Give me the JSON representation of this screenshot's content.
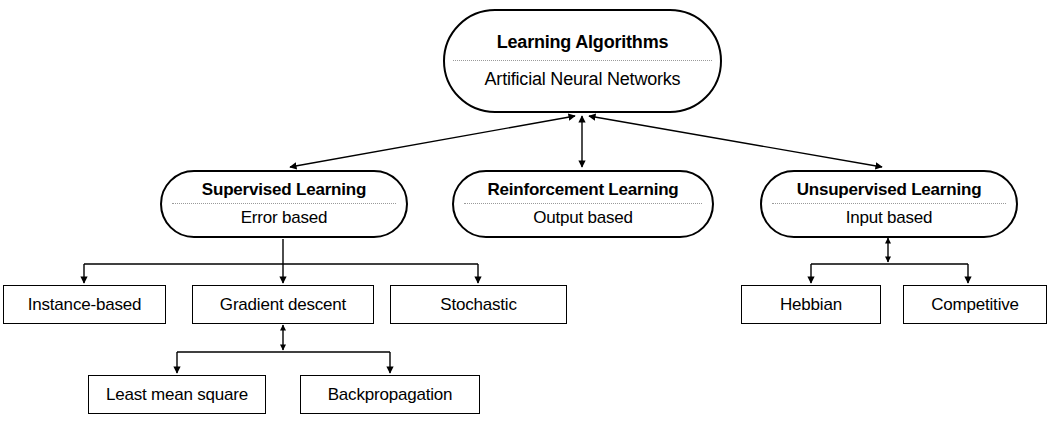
{
  "diagram": {
    "colors": {
      "stroke": "#000000",
      "background": "#ffffff",
      "divider": "#9a9a9a"
    },
    "root": {
      "title": "Learning Algorithms",
      "subtitle": "Artificial Neural Networks"
    },
    "paradigms": [
      {
        "title": "Supervised Learning",
        "subtitle": "Error based"
      },
      {
        "title": "Reinforcement Learning",
        "subtitle": "Output based"
      },
      {
        "title": "Unsupervised Learning",
        "subtitle": "Input based"
      }
    ],
    "supervised_methods": [
      {
        "label": "Instance-based"
      },
      {
        "label": "Gradient descent"
      },
      {
        "label": "Stochastic"
      }
    ],
    "gradient_descent_methods": [
      {
        "label": "Least mean square"
      },
      {
        "label": "Backpropagation"
      }
    ],
    "unsupervised_methods": [
      {
        "label": "Hebbian"
      },
      {
        "label": "Competitive"
      }
    ]
  }
}
